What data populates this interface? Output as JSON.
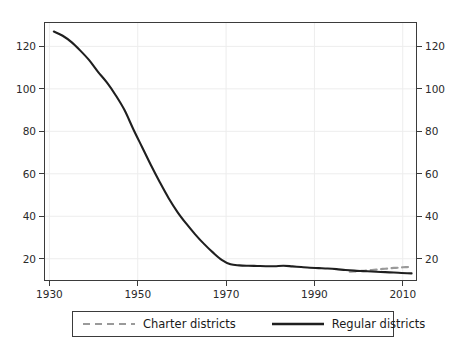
{
  "chart_data": {
    "type": "line",
    "title": "",
    "xlabel": "",
    "ylabel": "",
    "xlim": [
      1929,
      2013
    ],
    "ylim": [
      10,
      131
    ],
    "xticks": [
      1930,
      1950,
      1970,
      1990,
      2010
    ],
    "xtick_labels": [
      "1930",
      "1950",
      "1970",
      "1990",
      "2010"
    ],
    "yticks": [
      20,
      40,
      60,
      80,
      100,
      120
    ],
    "ytick_labels": [
      "20",
      "40",
      "60",
      "80",
      "100",
      "120"
    ],
    "y_axis_right_labels": [
      "20",
      "40",
      "60",
      "80",
      "100",
      "120"
    ],
    "grid": true,
    "legend_position": "below-center",
    "series": [
      {
        "name": "Charter districts",
        "style": "dashed",
        "color": "#9a9a9a",
        "x": [
          1998,
          1999,
          2000,
          2001,
          2002,
          2003,
          2004,
          2005,
          2006,
          2007,
          2008,
          2009,
          2010,
          2011,
          2012
        ],
        "values": [
          13.9,
          14.0,
          14.2,
          14.3,
          14.5,
          14.7,
          14.9,
          15.1,
          15.3,
          15.5,
          15.7,
          15.8,
          16.0,
          16.1,
          16.2
        ]
      },
      {
        "name": "Regular districts",
        "style": "solid",
        "color": "#1f1f1f",
        "x": [
          1931,
          1933,
          1935,
          1937,
          1939,
          1941,
          1943,
          1945,
          1947,
          1949,
          1951,
          1953,
          1955,
          1957,
          1959,
          1961,
          1963,
          1965,
          1967,
          1969,
          1971,
          1973,
          1975,
          1977,
          1979,
          1981,
          1983,
          1985,
          1987,
          1989,
          1991,
          1993,
          1995,
          1997,
          1999,
          2001,
          2003,
          2005,
          2007,
          2009,
          2011,
          2012
        ],
        "values": [
          127.0,
          125.0,
          122.0,
          118.0,
          113.5,
          108.0,
          103.0,
          97.0,
          90.0,
          81.0,
          72.5,
          64.0,
          56.0,
          48.5,
          42.0,
          36.5,
          31.5,
          27.0,
          23.0,
          19.5,
          17.4,
          16.9,
          16.7,
          16.6,
          16.5,
          16.5,
          16.7,
          16.4,
          16.1,
          15.8,
          15.6,
          15.4,
          15.1,
          14.7,
          14.4,
          14.2,
          14.0,
          13.8,
          13.6,
          13.4,
          13.2,
          13.1
        ]
      }
    ]
  },
  "legend": {
    "items": [
      {
        "label": "Charter districts",
        "key": "dashed-line-key"
      },
      {
        "label": "Regular districts",
        "key": "solid-line-key"
      }
    ]
  },
  "colors": {
    "frame": "#3b3b3b",
    "grid": "#ededed",
    "regular_line": "#1f1f1f",
    "charter_line": "#9a9a9a",
    "background": "#ffffff",
    "text": "#2a2a2a"
  }
}
